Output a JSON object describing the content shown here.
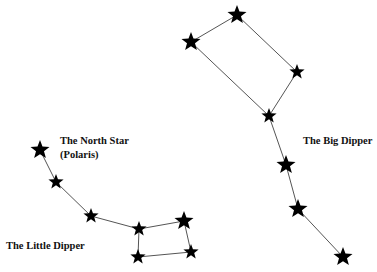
{
  "diagram": {
    "colors": {
      "star": "#000000",
      "line": "#555555",
      "text": "#111111",
      "background": "#ffffff"
    },
    "constellations": [
      {
        "id": "big-dipper",
        "label": "The Big Dipper",
        "stars": [
          {
            "id": "bd1",
            "x": 191,
            "y": 42,
            "size": 10
          },
          {
            "id": "bd2",
            "x": 237,
            "y": 15,
            "size": 10
          },
          {
            "id": "bd3",
            "x": 297,
            "y": 72,
            "size": 8
          },
          {
            "id": "bd4",
            "x": 269,
            "y": 116,
            "size": 8
          },
          {
            "id": "bd5",
            "x": 286,
            "y": 165,
            "size": 10
          },
          {
            "id": "bd6",
            "x": 298,
            "y": 209,
            "size": 10
          },
          {
            "id": "bd7",
            "x": 343,
            "y": 257,
            "size": 10
          }
        ],
        "connections": [
          [
            "bd1",
            "bd2"
          ],
          [
            "bd2",
            "bd3"
          ],
          [
            "bd3",
            "bd4"
          ],
          [
            "bd4",
            "bd1"
          ],
          [
            "bd4",
            "bd5"
          ],
          [
            "bd5",
            "bd6"
          ],
          [
            "bd6",
            "bd7"
          ]
        ]
      },
      {
        "id": "little-dipper",
        "label": "The Little Dipper",
        "stars": [
          {
            "id": "ld1",
            "x": 40,
            "y": 150,
            "size": 10,
            "name": "Polaris"
          },
          {
            "id": "ld2",
            "x": 56,
            "y": 182,
            "size": 8
          },
          {
            "id": "ld3",
            "x": 91,
            "y": 216,
            "size": 8
          },
          {
            "id": "ld4",
            "x": 139,
            "y": 229,
            "size": 8
          },
          {
            "id": "ld5",
            "x": 184,
            "y": 221,
            "size": 10
          },
          {
            "id": "ld6",
            "x": 191,
            "y": 252,
            "size": 8
          },
          {
            "id": "ld7",
            "x": 138,
            "y": 257,
            "size": 8
          }
        ],
        "connections": [
          [
            "ld1",
            "ld2"
          ],
          [
            "ld2",
            "ld3"
          ],
          [
            "ld3",
            "ld4"
          ],
          [
            "ld4",
            "ld5"
          ],
          [
            "ld5",
            "ld6"
          ],
          [
            "ld6",
            "ld7"
          ],
          [
            "ld7",
            "ld4"
          ]
        ]
      }
    ],
    "labels": {
      "big_dipper": "The Big Dipper",
      "little_dipper": "The Little Dipper",
      "north_star_line1": "The North Star",
      "north_star_line2": "(Polaris)"
    }
  }
}
